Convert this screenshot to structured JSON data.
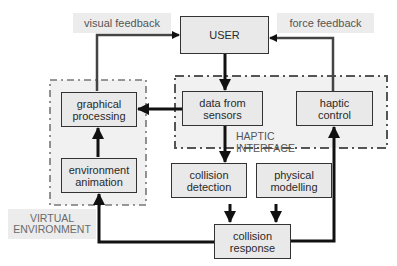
{
  "diagram": {
    "nodes": {
      "user": "USER",
      "data_from_sensors": [
        "data from",
        "sensors"
      ],
      "haptic_control": [
        "haptic",
        "control"
      ],
      "graphical_processing": [
        "graphical",
        "processing"
      ],
      "environment_animation": [
        "environment",
        "animation"
      ],
      "collision_detection": [
        "collision",
        "detection"
      ],
      "physical_modelling": [
        "physical",
        "modelling"
      ],
      "collision_response": [
        "collision",
        "response"
      ]
    },
    "edge_labels": {
      "visual_feedback": "visual feedback",
      "force_feedback": "force feedback"
    },
    "groups": {
      "haptic_interface": "HAPTIC INTERFACE",
      "virtual_environment": [
        "VIRTUAL",
        "ENVIRONMENT"
      ]
    },
    "edges": [
      {
        "from": "graphical_processing",
        "to": "user",
        "label": "visual feedback"
      },
      {
        "from": "haptic_control",
        "to": "user",
        "label": "force feedback"
      },
      {
        "from": "user",
        "to": "data_from_sensors"
      },
      {
        "from": "data_from_sensors",
        "to": "graphical_processing"
      },
      {
        "from": "data_from_sensors",
        "to": "collision_detection"
      },
      {
        "from": "environment_animation",
        "to": "graphical_processing"
      },
      {
        "from": "collision_detection",
        "to": "collision_response"
      },
      {
        "from": "physical_modelling",
        "to": "collision_response"
      },
      {
        "from": "collision_response",
        "to": "environment_animation"
      },
      {
        "from": "collision_response",
        "to": "haptic_control"
      }
    ]
  }
}
